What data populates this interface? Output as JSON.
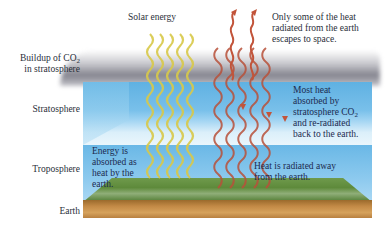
{
  "diagram": {
    "layer_labels": {
      "buildup_line1": "Buildup of CO",
      "buildup_sub": "2",
      "buildup_line2": "in stratosphere",
      "stratosphere": "Stratosphere",
      "troposphere": "Troposphere",
      "earth": "Earth"
    },
    "annotations": {
      "solar_energy": "Solar energy",
      "escape": [
        "Only some of the heat",
        "radiated from the earth",
        "escapes to space."
      ],
      "absorbed_line1": "Most heat",
      "absorbed_line2": "absorbed by",
      "absorbed_line3": "stratosphere CO",
      "absorbed_sub": "2",
      "absorbed_line4": "and re-radiated",
      "absorbed_line5": "back to the earth.",
      "energy_absorbed": [
        "Energy is",
        "absorbed as",
        "heat by the",
        "earth."
      ],
      "heat_radiated": [
        "Heat is radiated away",
        "from the earth."
      ]
    },
    "colors": {
      "solar_wave": "#d8c94a",
      "heat_wave": "#b8513a",
      "stratosphere": "#6fb9e6",
      "troposphere": "#7cc2ec",
      "grass": "#5e8a3b",
      "earth": "#c38a46",
      "cloud": "#7a7a88",
      "text": "#1c2a4f"
    }
  }
}
